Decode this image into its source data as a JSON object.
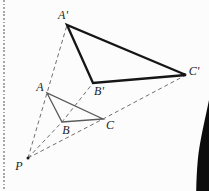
{
  "figure": {
    "colors": {
      "background": "#fcfcfc",
      "primary_triangle": "#5a5a5a",
      "image_triangle": "#161616",
      "dashed_ray": "#6f6f6f",
      "label": "#1c1c1c",
      "perforation": "#a6a6a6",
      "corner_shape": "#0c0c0c"
    },
    "points": {
      "P": {
        "label": "P",
        "x": 28,
        "y": 158,
        "label_x": 19,
        "label_y": 166
      },
      "A": {
        "label": "A",
        "x": 47,
        "y": 93,
        "label_x": 40,
        "label_y": 87
      },
      "B": {
        "label": "B",
        "x": 62,
        "y": 122,
        "label_x": 66,
        "label_y": 130
      },
      "C": {
        "label": "C",
        "x": 103,
        "y": 119,
        "label_x": 110,
        "label_y": 125
      },
      "A2": {
        "label": "A'",
        "x": 67,
        "y": 25,
        "label_x": 63,
        "label_y": 15
      },
      "B2": {
        "label": "B'",
        "x": 93,
        "y": 83,
        "label_x": 99,
        "label_y": 91
      },
      "C2": {
        "label": "C'",
        "x": 186,
        "y": 75,
        "label_x": 194,
        "label_y": 71
      }
    },
    "triangles": [
      {
        "name": "triangle-ABC",
        "points": [
          "A",
          "B",
          "C"
        ],
        "stroke": "#5a5a5a",
        "width": 1.3
      },
      {
        "name": "triangle-A-B-C-prime",
        "points": [
          "A2",
          "B2",
          "C2"
        ],
        "stroke": "#161616",
        "width": 2.3
      }
    ],
    "dashed_rays": [
      {
        "name": "ray-P-A-Aprime",
        "points": [
          "P",
          "A",
          "A2"
        ]
      },
      {
        "name": "ray-P-B-Bprime",
        "points": [
          "P",
          "B",
          "B2"
        ]
      },
      {
        "name": "ray-P-C-Cprime",
        "points": [
          "P",
          "C",
          "C2"
        ]
      }
    ]
  }
}
